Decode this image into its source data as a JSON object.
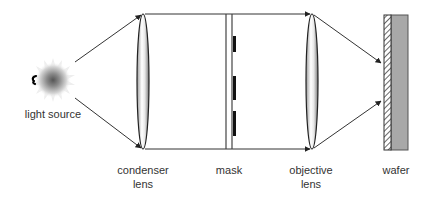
{
  "diagram": {
    "components": [
      {
        "id": "light_source",
        "label": "light source"
      },
      {
        "id": "condenser_lens",
        "label_line1": "condenser",
        "label_line2": "lens"
      },
      {
        "id": "mask",
        "label": "mask"
      },
      {
        "id": "objective_lens",
        "label_line1": "objective",
        "label_line2": "lens"
      },
      {
        "id": "wafer",
        "label": "wafer"
      }
    ],
    "colors": {
      "line": "#333333",
      "mask_pattern": "#111111",
      "wafer_fill": "#a8a8a8",
      "resist_hatch": "#444444",
      "label": "#333333"
    }
  }
}
